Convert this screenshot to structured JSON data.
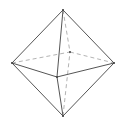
{
  "diagram": {
    "colors": {
      "background": "#ffffff",
      "visible_edge": "#555555",
      "hidden_edge": "#aaaaaa",
      "vertex": "#444444"
    },
    "vertices": {
      "top": [
        63,
        10
      ],
      "bottom": [
        63,
        116
      ],
      "left": [
        12,
        63
      ],
      "right": [
        114,
        63
      ],
      "front": [
        57,
        77
      ],
      "back": [
        70,
        52
      ]
    },
    "visible_edges": [
      [
        "top",
        "left"
      ],
      [
        "top",
        "right"
      ],
      [
        "top",
        "front"
      ],
      [
        "bottom",
        "left"
      ],
      [
        "bottom",
        "right"
      ],
      [
        "bottom",
        "front"
      ],
      [
        "left",
        "front"
      ],
      [
        "front",
        "right"
      ]
    ],
    "hidden_edges": [
      [
        "top",
        "back"
      ],
      [
        "bottom",
        "back"
      ],
      [
        "left",
        "back"
      ],
      [
        "back",
        "right"
      ]
    ]
  }
}
